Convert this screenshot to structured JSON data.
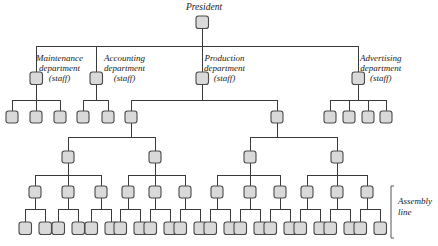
{
  "diagram": {
    "type": "organizational-chart",
    "title": "President",
    "style": {
      "node_fill": "#d9d9d9",
      "node_stroke": "#4a4a4a",
      "link_stroke": "#3a3a3a",
      "background": "#ffffff"
    },
    "root": {
      "label": "President",
      "id": "president"
    },
    "departments": [
      {
        "id": "maintenance",
        "line1": "Maintenance",
        "line2": "department",
        "line3": "(staff)",
        "children_count": 3
      },
      {
        "id": "accounting",
        "line1": "Accounting",
        "line2": "department",
        "line3": "(staff)",
        "children_count": 2
      },
      {
        "id": "production",
        "line1": "Production",
        "line2": "department",
        "line3": "(staff)",
        "children_count": 2
      },
      {
        "id": "advertising",
        "line1": "Advertising",
        "line2": "department",
        "line3": "(staff)",
        "children_count": 4
      }
    ],
    "annotations": [
      {
        "id": "assembly-line",
        "line1": "Assembly",
        "line2": "line"
      }
    ],
    "levels": [
      {
        "level": 0,
        "name": "president",
        "node_count": 1
      },
      {
        "level": 1,
        "name": "departments",
        "node_count": 4
      },
      {
        "level": 2,
        "name": "department-staff",
        "node_count": 11
      },
      {
        "level": 3,
        "name": "production-supervisors",
        "node_count": 4
      },
      {
        "level": 4,
        "name": "production-foremen",
        "node_count": 12
      },
      {
        "level": 5,
        "name": "assembly-workers",
        "node_count": 24
      }
    ]
  }
}
